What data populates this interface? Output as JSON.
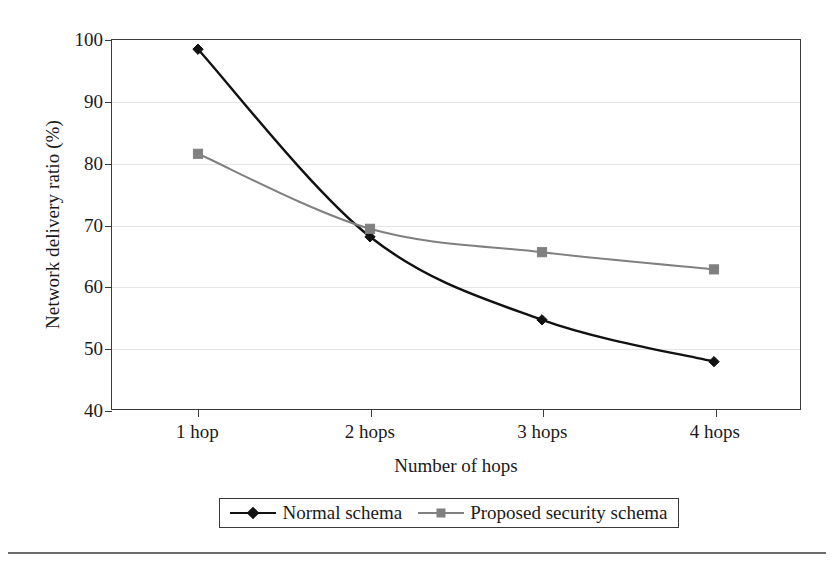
{
  "chart_data": {
    "type": "line",
    "title": "",
    "xlabel": "Number of hops",
    "ylabel": "Network delivery ratio (%)",
    "categories": [
      "1 hop",
      "2 hops",
      "3 hops",
      "4 hops"
    ],
    "ylim": [
      40,
      100
    ],
    "yticks": [
      40,
      50,
      60,
      70,
      80,
      90,
      100
    ],
    "ytick_labels": [
      "40",
      "50",
      "60",
      "70",
      "80",
      "90",
      "100"
    ],
    "grid": "horizontal",
    "legend_position": "bottom",
    "smoothing": "spline",
    "series": [
      {
        "name": "Normal schema",
        "values": [
          98.5,
          68.0,
          54.5,
          47.7
        ],
        "color": "#111111",
        "marker": "diamond"
      },
      {
        "name": "Proposed security schema",
        "values": [
          81.5,
          69.3,
          65.5,
          62.7
        ],
        "color": "#808080",
        "marker": "square"
      }
    ]
  },
  "axes": {
    "y_title": "Network delivery ratio (%)",
    "x_title": "Number of hops",
    "y_tick_labels": [
      "100",
      "90",
      "80",
      "70",
      "60",
      "50",
      "40"
    ],
    "x_tick_labels": [
      "1 hop",
      "2 hops",
      "3 hops",
      "4 hops"
    ]
  },
  "legend": {
    "entries": [
      {
        "label": "Normal schema",
        "color": "#111111",
        "marker": "diamond"
      },
      {
        "label": "Proposed security schema",
        "color": "#808080",
        "marker": "square"
      }
    ]
  },
  "caption": {
    "text": ""
  },
  "colors": {
    "series_1": "#111111",
    "series_2": "#808080",
    "frame": "#3a3a3a",
    "gridline": "#e6e6e8",
    "background": "#ffffff"
  }
}
